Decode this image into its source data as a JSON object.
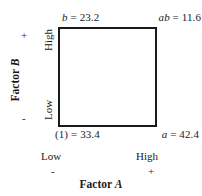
{
  "figure": {
    "type": "2k-factorial-design-square",
    "background_color": "#ffffff",
    "line_color": "#1a1a1a"
  },
  "chart_data": {
    "type": "scatter",
    "title": "",
    "subtitle": "",
    "xlabel": "Factor A",
    "ylabel": "Factor B",
    "grid": false,
    "legend": null,
    "x_tick_labels": [
      "Low",
      "High"
    ],
    "x_sign_labels": [
      "-",
      "+"
    ],
    "y_tick_labels": [
      "Low",
      "High"
    ],
    "y_sign_labels": [
      "-",
      "+"
    ],
    "points": [
      {
        "treatment": "(1)",
        "x": "Low",
        "y": "Low",
        "value": 33.4,
        "label": "(1) = 33.4",
        "corner": "bottom-left"
      },
      {
        "treatment": "a",
        "x": "High",
        "y": "Low",
        "value": 42.4,
        "label": "a = 42.4",
        "corner": "bottom-right"
      },
      {
        "treatment": "b",
        "x": "Low",
        "y": "High",
        "value": 23.2,
        "label": "b = 23.2",
        "corner": "top-left"
      },
      {
        "treatment": "ab",
        "x": "High",
        "y": "High",
        "value": 11.6,
        "label": "ab = 11.6",
        "corner": "top-right"
      }
    ]
  },
  "corners": {
    "top_left": {
      "symbol": "b",
      "equals": " = ",
      "value": "23.2"
    },
    "top_right": {
      "symbol": "ab",
      "equals": " = ",
      "value": "11.6"
    },
    "bottom_left": {
      "symbol": "(1)",
      "equals": " = ",
      "value": "33.4"
    },
    "bottom_right": {
      "symbol": "a",
      "equals": " = ",
      "value": "42.4"
    }
  },
  "axes": {
    "horizontal": {
      "title_prefix": "Factor ",
      "title_symbol": "A",
      "low_label": "Low",
      "low_sign": "-",
      "high_label": "High",
      "high_sign": "+"
    },
    "vertical": {
      "title_prefix": "Factor ",
      "title_symbol": "B",
      "low_label": "Low",
      "low_sign": "-",
      "high_label": "High",
      "high_sign": "+"
    }
  }
}
